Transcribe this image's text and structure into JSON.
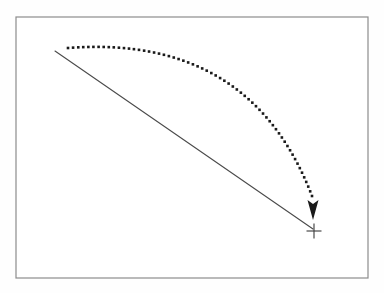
{
  "figure": {
    "title": "Trajectory diagram with dotted arc and straight line converging on a crosshair target",
    "background_color": "#fefefe",
    "canvas": {
      "width": 384,
      "height": 293
    }
  },
  "frame": {
    "label": "Diagram frame border",
    "stroke_color": "#8c8c8c",
    "stroke_width": 1.2,
    "fill_color": "#ffffff",
    "x": 16,
    "y": 17,
    "width": 352,
    "height": 261
  },
  "straight_line": {
    "label": "Straight line of sight",
    "stroke_color": "#4a4a4a",
    "stroke_width": 1.1,
    "start": {
      "x": 55,
      "y": 51
    },
    "end": {
      "x": 313,
      "y": 229
    }
  },
  "dotted_arc": {
    "label": "Dotted curved trajectory",
    "dot_color": "#1a1a1a",
    "dot_size": 2.6,
    "dot_spacing": 4.9,
    "dot_count": 62,
    "start": {
      "x": 68,
      "y": 48
    },
    "control": {
      "x": 250,
      "y": 34
    },
    "end": {
      "x": 312,
      "y": 196
    }
  },
  "arrowhead": {
    "label": "Solid arrowhead pointing down",
    "fill_color": "#1a1a1a",
    "tip": {
      "x": 313,
      "y": 220
    },
    "width": 11,
    "height": 20,
    "notch_depth": 4
  },
  "target_crosshair": {
    "label": "Crosshair target marker",
    "stroke_color": "#3a3a3a",
    "stroke_width": 1.1,
    "center": {
      "x": 314,
      "y": 231
    },
    "arm_length": 7.5
  }
}
